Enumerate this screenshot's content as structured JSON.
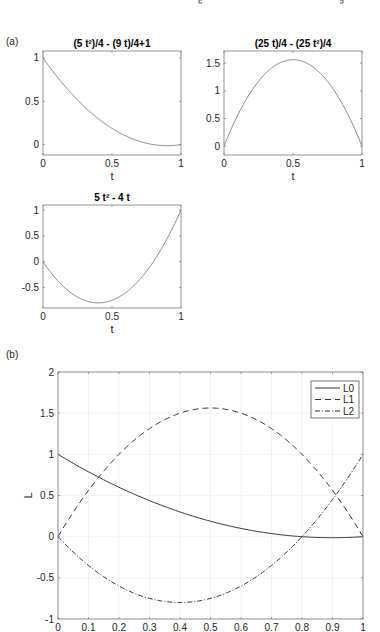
{
  "header": {
    "bracket_left_x": 199,
    "bracket_right_x": 343
  },
  "panels": {
    "a_label": "(a)",
    "b_label": "(b)"
  },
  "chart_data": [
    {
      "type": "line",
      "title": "(5 t²)/4 - (9 t)/4+1",
      "xlabel": "t",
      "ylabel": "",
      "xlim": [
        0,
        1
      ],
      "ylim": [
        -0.12,
        1.08
      ],
      "xticks": [
        0,
        0.5,
        1
      ],
      "xtick_labels": [
        "0",
        "0.5",
        "1"
      ],
      "yticks": [
        0,
        0.5,
        1
      ],
      "ytick_labels": [
        "0",
        "0.5",
        "1"
      ],
      "expr": "1.25*t*t - 2.25*t + 1",
      "box": [
        43,
        51,
        181,
        155
      ],
      "series": [
        {
          "name": "L0",
          "x": [
            0,
            0.1,
            0.2,
            0.3,
            0.4,
            0.5,
            0.6,
            0.7,
            0.8,
            0.9,
            1
          ],
          "values": [
            1,
            0.7875,
            0.6,
            0.4375,
            0.3,
            0.1875,
            0.1,
            0.0375,
            0,
            -0.0125,
            0
          ]
        }
      ],
      "grid": false
    },
    {
      "type": "line",
      "title": "(25 t)/4 - (25 t²)/4",
      "xlabel": "t",
      "ylabel": "",
      "xlim": [
        0,
        1
      ],
      "ylim": [
        -0.16,
        1.72
      ],
      "xticks": [
        0,
        0.5,
        1
      ],
      "xtick_labels": [
        "0",
        "0.5",
        "1"
      ],
      "yticks": [
        0,
        0.5,
        1,
        1.5
      ],
      "ytick_labels": [
        "0",
        "0.5",
        "1",
        "1.5"
      ],
      "expr": "6.25*t - 6.25*t*t",
      "box": [
        224,
        51,
        362,
        155
      ],
      "series": [
        {
          "name": "L1",
          "x": [
            0,
            0.1,
            0.2,
            0.3,
            0.4,
            0.5,
            0.6,
            0.7,
            0.8,
            0.9,
            1
          ],
          "values": [
            0,
            0.5625,
            1,
            1.3125,
            1.5,
            1.5625,
            1.5,
            1.3125,
            1,
            0.5625,
            0
          ]
        }
      ],
      "grid": false
    },
    {
      "type": "line",
      "title": "5 t² - 4 t",
      "xlabel": "t",
      "ylabel": "",
      "xlim": [
        0,
        1
      ],
      "ylim": [
        -0.9,
        1.1
      ],
      "xticks": [
        0,
        0.5,
        1
      ],
      "xtick_labels": [
        "0",
        "0.5",
        "1"
      ],
      "yticks": [
        -0.5,
        0,
        0.5,
        1
      ],
      "ytick_labels": [
        "-0.5",
        "0",
        "0.5",
        "1"
      ],
      "expr": "5*t*t - 4*t",
      "box": [
        43,
        205,
        181,
        308
      ],
      "series": [
        {
          "name": "L2",
          "x": [
            0,
            0.1,
            0.2,
            0.3,
            0.4,
            0.5,
            0.6,
            0.7,
            0.8,
            0.9,
            1
          ],
          "values": [
            0,
            -0.35,
            -0.6,
            -0.75,
            -0.8,
            -0.75,
            -0.6,
            -0.35,
            0,
            0.45,
            1
          ]
        }
      ],
      "grid": false
    },
    {
      "type": "line",
      "title": "",
      "xlabel": "",
      "ylabel": "L",
      "xlim": [
        0,
        1
      ],
      "ylim": [
        -1,
        2
      ],
      "xticks": [
        0,
        0.1,
        0.2,
        0.3,
        0.4,
        0.5,
        0.6,
        0.7,
        0.8,
        0.9,
        1
      ],
      "xtick_labels": [
        "0",
        "0.1",
        "0.2",
        "0.3",
        "0.4",
        "0.5",
        "0.6",
        "0.7",
        "0.8",
        "0.9",
        "1"
      ],
      "yticks": [
        -1,
        -0.5,
        0,
        0.5,
        1,
        1.5,
        2
      ],
      "ytick_labels": [
        "-1",
        "-0.5",
        "0",
        "0.5",
        "1",
        "1.5",
        "2"
      ],
      "box": [
        58,
        372,
        363,
        619
      ],
      "grid": true,
      "legend_position": "northeast",
      "legend": [
        "L0",
        "L1",
        "L2"
      ],
      "series": [
        {
          "name": "L0",
          "style": "solid",
          "expr": "1.25*t*t - 2.25*t + 1",
          "x": [
            0,
            0.1,
            0.2,
            0.3,
            0.4,
            0.5,
            0.6,
            0.7,
            0.8,
            0.9,
            1
          ],
          "values": [
            1,
            0.7875,
            0.6,
            0.4375,
            0.3,
            0.1875,
            0.1,
            0.0375,
            0,
            -0.0125,
            0
          ]
        },
        {
          "name": "L1",
          "style": "dashed",
          "expr": "6.25*t - 6.25*t*t",
          "x": [
            0,
            0.1,
            0.2,
            0.3,
            0.4,
            0.5,
            0.6,
            0.7,
            0.8,
            0.9,
            1
          ],
          "values": [
            0,
            0.5625,
            1,
            1.3125,
            1.5,
            1.5625,
            1.5,
            1.3125,
            1,
            0.5625,
            0
          ]
        },
        {
          "name": "L2",
          "style": "dashdot",
          "expr": "5*t*t - 4*t",
          "x": [
            0,
            0.1,
            0.2,
            0.3,
            0.4,
            0.5,
            0.6,
            0.7,
            0.8,
            0.9,
            1
          ],
          "values": [
            0,
            -0.35,
            -0.6,
            -0.75,
            -0.8,
            -0.75,
            -0.6,
            -0.35,
            0,
            0.45,
            1
          ]
        }
      ]
    }
  ],
  "colors": {
    "axis": "#262626",
    "line": "#555555",
    "grid": "#ebebeb",
    "box": "#7a7a7a"
  }
}
